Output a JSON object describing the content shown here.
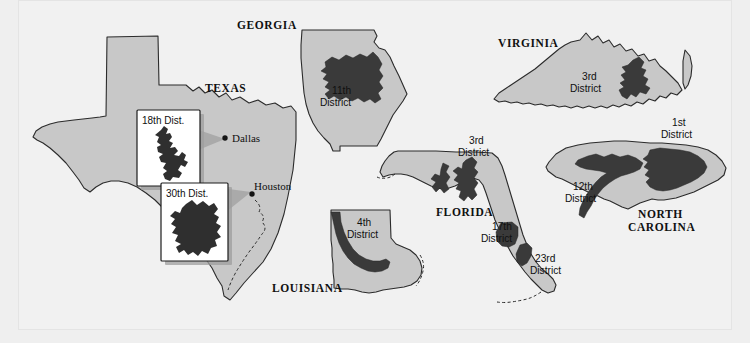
{
  "figure": {
    "colors": {
      "background": "#efefef",
      "panel": "#f1f1f1",
      "state_fill": "#c8c8c8",
      "state_outline": "#2b2b2b",
      "district_fill": "#3a3a3a",
      "callout_cone": "#a9a9a9",
      "inset_background": "#ffffff",
      "text": "#101010"
    }
  },
  "states": {
    "texas": {
      "name": "TEXAS",
      "cities": [
        {
          "name": "Dallas"
        },
        {
          "name": "Houston"
        }
      ],
      "insets": [
        {
          "label": "18th Dist.",
          "linked_city": "Dallas"
        },
        {
          "label": "30th Dist.",
          "linked_city": "Houston"
        }
      ]
    },
    "georgia": {
      "name": "GEORGIA",
      "districts": [
        {
          "number": "11th",
          "word": "District"
        }
      ]
    },
    "virginia": {
      "name": "VIRGINIA",
      "districts": [
        {
          "number": "3rd",
          "word": "District"
        }
      ]
    },
    "north_carolina": {
      "name_line1": "NORTH",
      "name_line2": "CAROLINA",
      "districts": [
        {
          "number": "1st",
          "word": "District"
        },
        {
          "number": "12th",
          "word": "District"
        }
      ]
    },
    "florida": {
      "name": "FLORIDA",
      "districts": [
        {
          "number": "3rd",
          "word": "District"
        },
        {
          "number": "17th",
          "word": "District"
        },
        {
          "number": "23rd",
          "word": "District"
        }
      ]
    },
    "louisiana": {
      "name": "LOUISIANA",
      "districts": [
        {
          "number": "4th",
          "word": "District"
        }
      ]
    }
  }
}
